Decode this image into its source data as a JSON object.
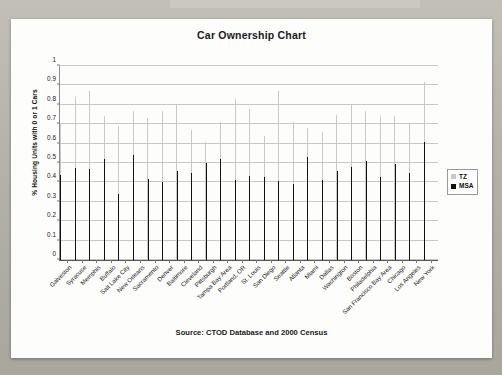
{
  "slide": {
    "card_background": "#fdfdfc",
    "backdrop_color": "#b9b6ae"
  },
  "chart_data": {
    "type": "bar",
    "title": "Car Ownership Chart",
    "subtitle": "",
    "xlabel": "",
    "ylabel": "% Housing Units with 0 or 1 Cars",
    "source_note": "Source: CTOD Database and 2000 Census",
    "ylim": [
      0,
      1
    ],
    "yticks": [
      "0",
      "0.1",
      "0.2",
      "0.3",
      "0.4",
      "0.5",
      "0.6",
      "0.7",
      "0.8",
      "0.9",
      "1"
    ],
    "ytick_values": [
      0,
      0.1,
      0.2,
      0.3,
      0.4,
      0.5,
      0.6,
      0.7,
      0.8,
      0.9,
      1
    ],
    "grid": true,
    "legend_position": "right",
    "colors": {
      "TZ": "#c9c9c9",
      "MSA": "#111111"
    },
    "categories": [
      "Galveston",
      "Syracuse",
      "Memphis",
      "Buffalo",
      "Salt Lake City",
      "New Orleans",
      "Sacramento",
      "Denver",
      "Baltimore",
      "Cleveland",
      "Pittsburgh",
      "Tampa Bay Area",
      "Portland, OR",
      "St. Louis",
      "San Diego",
      "Seattle",
      "Atlanta",
      "Miami",
      "Dallas",
      "Washington",
      "Boston",
      "Philadelphia",
      "San Francisco Bay Area",
      "Chicago",
      "Los Angeles",
      "New York"
    ],
    "series": [
      {
        "name": "TZ",
        "color": "#c9c9c9",
        "values": [
          0.7,
          0.84,
          0.87,
          0.74,
          0.69,
          0.77,
          0.73,
          0.77,
          0.8,
          0.67,
          0.61,
          0.71,
          0.83,
          0.78,
          0.64,
          0.87,
          0.71,
          0.68,
          0.66,
          0.75,
          0.8,
          0.77,
          0.74,
          0.74,
          0.7,
          0.92
        ]
      },
      {
        "name": "MSA",
        "color": "#111111",
        "values": [
          0.44,
          0.475,
          0.47,
          0.52,
          0.34,
          0.54,
          0.42,
          0.4,
          0.46,
          0.45,
          0.5,
          0.52,
          0.41,
          0.435,
          0.43,
          0.405,
          0.39,
          0.53,
          0.415,
          0.46,
          0.48,
          0.51,
          0.43,
          0.495,
          0.45,
          0.61
        ]
      }
    ]
  },
  "legend": {
    "items": [
      {
        "label": "TZ",
        "color": "#c9c9c9"
      },
      {
        "label": "MSA",
        "color": "#111111"
      }
    ]
  }
}
